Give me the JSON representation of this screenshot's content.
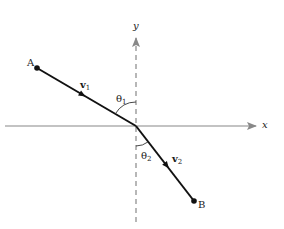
{
  "diagram": {
    "title": "",
    "axes": {
      "x_label": "x",
      "y_label": "y",
      "axis_color": "#888888"
    },
    "points": {
      "A": {
        "label": "A",
        "x": 37,
        "y": 68
      },
      "O": {
        "x": 136,
        "y": 126
      },
      "B": {
        "label": "B",
        "x": 194,
        "y": 201
      }
    },
    "vectors": [
      {
        "name": "v1",
        "label": "v",
        "sub": "1",
        "from": "A",
        "to": "O"
      },
      {
        "name": "v2",
        "label": "v",
        "sub": "2",
        "from": "O",
        "to": "B"
      }
    ],
    "angles": [
      {
        "name": "theta1",
        "label": "θ",
        "sub": "1",
        "between": "segment AO and positive y-axis"
      },
      {
        "name": "theta2",
        "label": "θ",
        "sub": "2",
        "between": "segment OB and negative y-axis"
      }
    ],
    "colors": {
      "path": "#111111",
      "axes": "#888888",
      "text": "#1a1a1a"
    }
  }
}
